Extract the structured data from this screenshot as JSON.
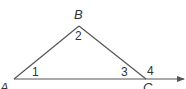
{
  "diagram": {
    "type": "triangle-with-exterior-angle",
    "line_color": "#555555",
    "label_color": "#333333",
    "vertices": {
      "A": {
        "label": "A",
        "x": 14,
        "y": 79
      },
      "B": {
        "label": "B",
        "x": 79,
        "y": 26
      },
      "C": {
        "label": "C",
        "x": 146,
        "y": 79
      }
    },
    "angles": [
      {
        "label": "1",
        "at": "A"
      },
      {
        "label": "2",
        "at": "B"
      },
      {
        "label": "3",
        "at": "C (interior)"
      },
      {
        "label": "4",
        "at": "C (exterior)"
      }
    ],
    "ray": {
      "from": "A",
      "through": "C",
      "arrow": true
    }
  }
}
